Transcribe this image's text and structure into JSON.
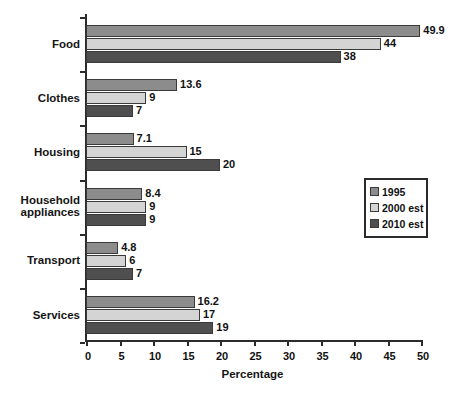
{
  "chart_data": {
    "type": "bar",
    "orientation": "horizontal",
    "title": "",
    "xlabel": "Percentage",
    "ylabel": "",
    "xlim": [
      0,
      50
    ],
    "xticks": [
      0,
      5,
      10,
      15,
      20,
      25,
      30,
      35,
      40,
      45,
      50
    ],
    "grid": false,
    "legend_position": "center-right",
    "categories": [
      "Food",
      "Clothes",
      "Housing",
      "Household appliances",
      "Transport",
      "Services"
    ],
    "series": [
      {
        "name": "1995",
        "color": "#8c8c8c",
        "values": [
          49.9,
          13.6,
          7.1,
          8.4,
          4.8,
          16.2
        ],
        "labels": [
          "49.9",
          "13.6",
          "7.1",
          "8.4",
          "4.8",
          "16.2"
        ]
      },
      {
        "name": "2000 est",
        "color": "#d4d4d4",
        "values": [
          44,
          9,
          15,
          9,
          6,
          17
        ],
        "labels": [
          "44",
          "9",
          "15",
          "9",
          "6",
          "17"
        ]
      },
      {
        "name": "2010 est",
        "color": "#4f4f4f",
        "values": [
          38,
          7,
          20,
          9,
          7,
          19
        ],
        "labels": [
          "38",
          "7",
          "20",
          "9",
          "7",
          "19"
        ]
      }
    ]
  },
  "axis": {
    "tick_labels": [
      "0",
      "5",
      "10",
      "15",
      "20",
      "25",
      "30",
      "35",
      "40",
      "45",
      "50"
    ],
    "title": "Percentage"
  },
  "categories": {
    "items": [
      {
        "label": "Food",
        "lines": [
          "Food"
        ]
      },
      {
        "label": "Clothes",
        "lines": [
          "Clothes"
        ]
      },
      {
        "label": "Housing",
        "lines": [
          "Housing"
        ]
      },
      {
        "label": "Household appliances",
        "lines": [
          "Household",
          "appliances"
        ]
      },
      {
        "label": "Transport",
        "lines": [
          "Transport"
        ]
      },
      {
        "label": "Services",
        "lines": [
          "Services"
        ]
      }
    ]
  },
  "legend": {
    "items": [
      {
        "label": "1995",
        "color": "#8c8c8c"
      },
      {
        "label": "2000 est",
        "color": "#d4d4d4"
      },
      {
        "label": "2010 est",
        "color": "#4f4f4f"
      }
    ]
  },
  "colors": {
    "series_1995": "#8c8c8c",
    "series_2000": "#d4d4d4",
    "series_2010": "#4f4f4f",
    "axis": "#2b2b2b",
    "text": "#111111",
    "background": "#ffffff"
  }
}
